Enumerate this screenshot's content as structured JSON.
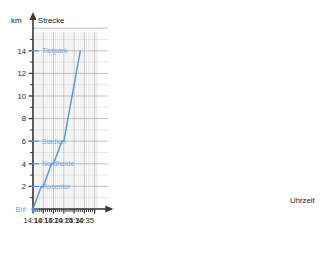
{
  "chart_data": {
    "type": "line",
    "title": "",
    "ylabel": "Strecke",
    "yunit": "km",
    "xlabel": "Uhrzeit",
    "x_tick_labels": [
      "14:10",
      "14:15",
      "14:20",
      "14:25",
      "14:30",
      "14:35"
    ],
    "y_tick_labels": [
      "2",
      "4",
      "6",
      "8",
      "10",
      "12",
      "14"
    ],
    "xlim": [
      "14:10",
      "14:35"
    ],
    "ylim": [
      0,
      15
    ],
    "grid": true,
    "legend": "none",
    "x_minor_tick_interval_minutes": 1,
    "y_minor_tick_interval_km": 1,
    "x": [
      "14:10",
      "14:14",
      "14:15",
      "14:19",
      "14:20",
      "14:24",
      "14:25",
      "14:33"
    ],
    "values": [
      0,
      2,
      2,
      4,
      4,
      6,
      6,
      14
    ],
    "series": [
      {
        "name": "Strecke",
        "color": "#5b9bd5",
        "points": [
          {
            "time": "14:10",
            "km": 0
          },
          {
            "time": "14:14",
            "km": 2
          },
          {
            "time": "14:15",
            "km": 2
          },
          {
            "time": "14:19",
            "km": 4
          },
          {
            "time": "14:20",
            "km": 4
          },
          {
            "time": "14:24",
            "km": 6
          },
          {
            "time": "14:25",
            "km": 6
          },
          {
            "time": "14:33",
            "km": 14
          }
        ]
      }
    ],
    "annotations": [
      {
        "label": "Bhf",
        "km": 0
      },
      {
        "label": "Rosentor",
        "km": 2
      },
      {
        "label": "Nordheide",
        "km": 4
      },
      {
        "label": "Stadion",
        "km": 6
      },
      {
        "label": "Tierpark",
        "km": 14
      }
    ]
  },
  "colors": {
    "series": "#5b9bd5",
    "station_label": "#6fa8dc",
    "grid_minor": "#d8d8d8",
    "grid_major": "#a8a8a8",
    "axis": "#3a3a3a",
    "background": "#ffffff"
  },
  "axes": {
    "y_unit_label": "km",
    "y_name": "Strecke",
    "x_name": "Uhrzeit",
    "y_ticks": [
      {
        "label": "2",
        "value": 2
      },
      {
        "label": "4",
        "value": 4
      },
      {
        "label": "6",
        "value": 6
      },
      {
        "label": "8",
        "value": 8
      },
      {
        "label": "10",
        "value": 10
      },
      {
        "label": "12",
        "value": 12
      },
      {
        "label": "14",
        "value": 14
      }
    ],
    "x_ticks": [
      {
        "label": "14:10",
        "value": 0
      },
      {
        "label": "14:15",
        "value": 5
      },
      {
        "label": "14:20",
        "value": 10
      },
      {
        "label": "14:25",
        "value": 15
      },
      {
        "label": "14:30",
        "value": 20
      },
      {
        "label": "14:35",
        "value": 25
      }
    ]
  },
  "stations": [
    {
      "label": "Bhf",
      "km": 0
    },
    {
      "label": "Rosentor",
      "km": 2
    },
    {
      "label": "Nordheide",
      "km": 4
    },
    {
      "label": "Stadion",
      "km": 6
    },
    {
      "label": "Tierpark",
      "km": 14
    }
  ]
}
